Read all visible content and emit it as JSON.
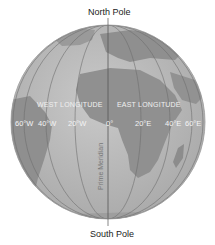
{
  "labels": {
    "north_pole": "North Pole",
    "south_pole": "South Pole",
    "west_longitude": "WEST LONGITUDE",
    "east_longitude": "EAST LONGITUDE",
    "prime_meridian": "Prime Meridian"
  },
  "longitudes": {
    "west": [
      "60°W",
      "40°W",
      "20°W"
    ],
    "zero": "0°",
    "east": [
      "20°E",
      "40°E",
      "60°E"
    ]
  },
  "colors": {
    "ocean": "#b9b9b9",
    "land": "#8e8e8e",
    "land_light": "#cfcfcf",
    "grid": "#6f6f6f",
    "outline": "#9a9a9a"
  }
}
